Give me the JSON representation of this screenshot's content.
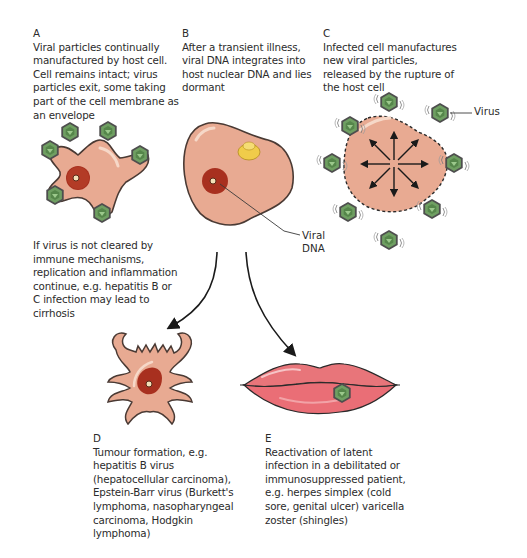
{
  "panels": {
    "A": {
      "label": "A",
      "text": "Viral particles continually\nmanufactured by host cell.\nCell remains intact; virus\nparticles exit, some taking\npart of the cell membrane as\nan envelope"
    },
    "B": {
      "label": "B",
      "text": "After a transient illness,\nviral DNA integrates into\nhost nuclear DNA and lies\ndormant"
    },
    "C": {
      "label": "C",
      "text": "Infected cell manufactures\nnew viral particles,\nreleased by the rupture of\nthe host cell"
    },
    "D": {
      "label": "D",
      "text": "Tumour formation, e.g.\nhepatitis B virus\n(hepatocellular carcinoma),\nEpstein-Barr virus (Burkett's\nlymphoma, nasopharyngeal\ncarcinoma, Hodgkin\nlymphoma)"
    },
    "E": {
      "label": "E",
      "text": "Reactivation of latent\ninfection in a debilitated or\nimmunosuppressed patient,\ne.g. herpes simplex (cold\nsore, genital ulcer) varicella\nzoster (shingles)"
    }
  },
  "note_A": {
    "text": "If virus is not cleared by\nimmune mechanisms,\nreplication and inflammation\ncontinue, e.g. hepatitis B or\nC infection may lead to\ncirrhosis"
  },
  "callouts": {
    "viral_dna": "Viral\nDNA",
    "virus": "Virus"
  },
  "colors": {
    "cell_fill": "#e8aa92",
    "cell_outline": "#4a3a34",
    "nucleus": "#a8301f",
    "virus_fill": "#6a9a5e",
    "virus_outline": "#3d3d3d",
    "lips": "#e86a72",
    "inclusion": "#f0cc4a"
  }
}
